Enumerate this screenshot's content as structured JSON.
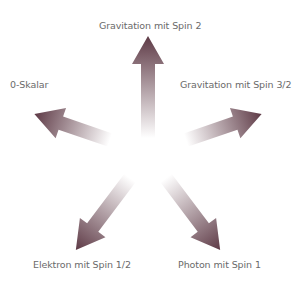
{
  "diagram": {
    "arrow_color": "#5e3a46",
    "center": [
      148,
      150
    ],
    "labels": {
      "top": "Gravitation mit Spin 2",
      "left": "0-Skalar",
      "right": "Gravitation mit Spin 3/2",
      "bottom_left": "Elektron mit Spin 1/2",
      "bottom_right": "Photon mit Spin 1"
    }
  }
}
